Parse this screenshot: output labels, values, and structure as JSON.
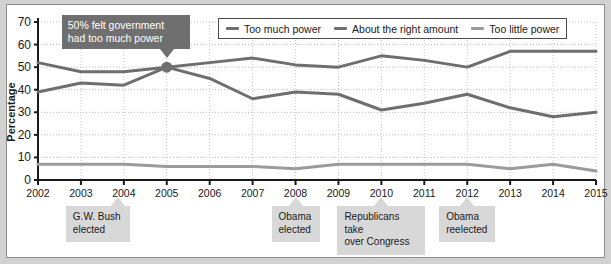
{
  "chart_data": {
    "type": "line",
    "title": "",
    "xlabel": "",
    "ylabel": "Percentage",
    "categories": [
      "2002",
      "2003",
      "2004",
      "2005",
      "2006",
      "2007",
      "2008",
      "2009",
      "2010",
      "2011",
      "2012",
      "2013",
      "2014",
      "2015"
    ],
    "ylim": [
      0,
      70
    ],
    "yticks": [
      0,
      10,
      20,
      30,
      40,
      50,
      60,
      70
    ],
    "grid": true,
    "legend_position": "top-right",
    "series": [
      {
        "name": "Too much power",
        "color": "#6e6e6e",
        "values": [
          39,
          43,
          42,
          50,
          45,
          36,
          39,
          38,
          31,
          34,
          38,
          32,
          28,
          30
        ]
      },
      {
        "name": "About the right amount",
        "color": "#6e6e6e",
        "values": [
          52,
          48,
          48,
          50,
          52,
          54,
          51,
          50,
          55,
          53,
          50,
          57,
          57,
          57
        ]
      },
      {
        "name": "Too little power",
        "color": "#9b9b9b",
        "values": [
          7,
          7,
          7,
          6,
          6,
          6,
          5,
          7,
          7,
          7,
          7,
          5,
          7,
          4
        ]
      }
    ],
    "annotations": [
      {
        "text_line1": "50% felt government",
        "text_line2": "had too much power",
        "at_year": "2005",
        "at_value": 50
      }
    ],
    "event_markers": [
      {
        "line1": "G.W. Bush",
        "line2": "elected",
        "at_year": "2004"
      },
      {
        "line1": "Obama",
        "line2": "elected",
        "at_year": "2008"
      },
      {
        "line1": "Republicans take",
        "line2": "over Congress",
        "at_year": "2010"
      },
      {
        "line1": "Obama",
        "line2": "reelected",
        "at_year": "2012"
      }
    ]
  }
}
